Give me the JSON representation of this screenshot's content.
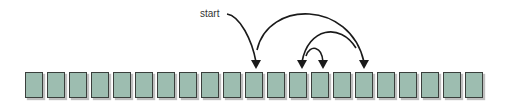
{
  "diagram": {
    "label": "start",
    "cell_count": 21,
    "cell_color": "#9dbdb0",
    "border_color": "#3a3f3c",
    "arrow_color": "#1a1a1a",
    "arrows": [
      {
        "from": "start-label",
        "to_cell": 10
      },
      {
        "from_cell": 10,
        "to_cell": 15,
        "type": "arc"
      },
      {
        "from_cell": 15,
        "to_cell": 12,
        "type": "arc"
      },
      {
        "from_cell": 12,
        "to_cell": 13,
        "type": "arc"
      }
    ]
  }
}
